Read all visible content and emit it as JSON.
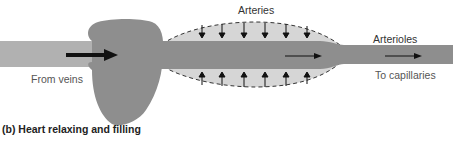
{
  "labels": {
    "arteries": "Arteries",
    "arterioles": "Arterioles",
    "from_veins": "From veins",
    "to_capillaries": "To capillaries"
  },
  "caption": "(b)  Heart relaxing and filling",
  "colors": {
    "vein": "#b1b1b1",
    "heart": "#8e8e8e",
    "artery_outer": "#d6d6d6",
    "artery_inner": "#8e8e8e",
    "arrow": "#111111"
  }
}
